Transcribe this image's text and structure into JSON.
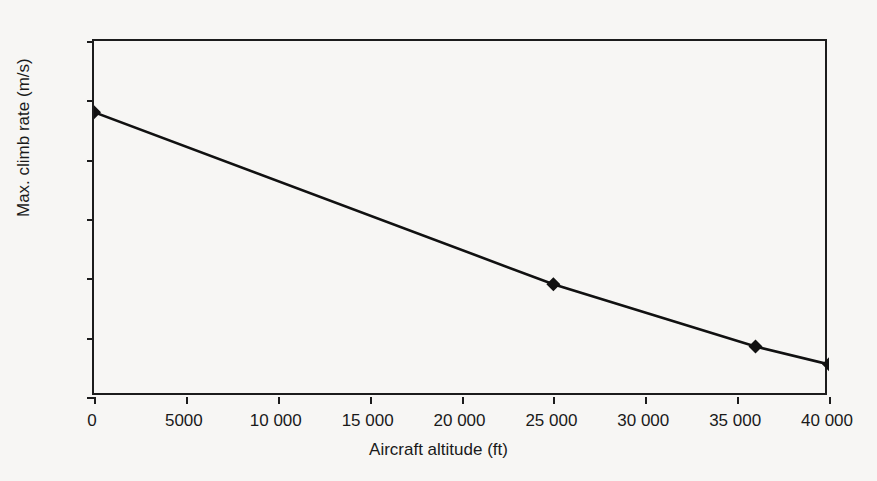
{
  "chart_data": {
    "type": "line",
    "title": "",
    "xlabel": "Aircraft altitude (ft)",
    "ylabel": "Max. climb rate (m/s)",
    "xlim": [
      0,
      40000
    ],
    "ylim": [
      0,
      60
    ],
    "xticks": [
      0,
      5000,
      10000,
      15000,
      20000,
      25000,
      30000,
      35000,
      40000
    ],
    "xticklabels": [
      "0",
      "5000",
      "10 000",
      "15 000",
      "20 000",
      "25 000",
      "30 000",
      "35 000",
      "40 000"
    ],
    "yticks": [
      0,
      10,
      20,
      30,
      40,
      50,
      60
    ],
    "yticklabels": [
      "0",
      "10",
      "20",
      "30",
      "40",
      "50",
      "60"
    ],
    "grid": "horizontal",
    "legend": "none",
    "series": [
      {
        "name": "Max. climb rate",
        "marker": "diamond",
        "color": "#111111",
        "x": [
          0,
          25000,
          36000,
          40000
        ],
        "values": [
          48,
          19,
          8.5,
          5.5
        ]
      }
    ]
  },
  "axis": {
    "x_title": "Aircraft altitude (ft)",
    "y_title": "Max. climb rate (m/s)"
  },
  "colors": {
    "line": "#111111",
    "grid": "#9a9a9a",
    "axis": "#1c1c1c",
    "background": "#f7f6f4"
  }
}
